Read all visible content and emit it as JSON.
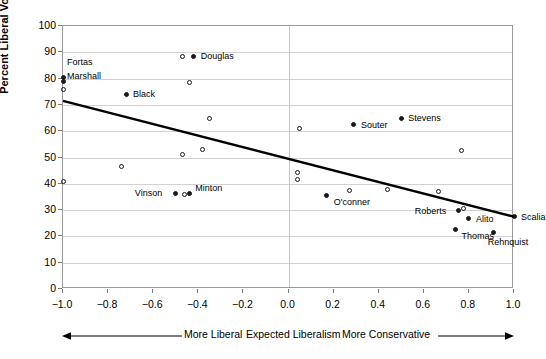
{
  "chart_data": {
    "type": "scatter",
    "title": "",
    "xlabel": "Expected Liberalism",
    "ylabel": "Percent Liberal Votes",
    "xlim": [
      -1.0,
      1.0
    ],
    "ylim": [
      0,
      100
    ],
    "grid": true,
    "legend": "none",
    "xticks": [
      "−1.0",
      "−0.8",
      "−0.6",
      "−0.4",
      "−0.2",
      "0.0",
      "0.2",
      "0.4",
      "0.6",
      "0.8",
      "1.0"
    ],
    "xtick_values": [
      -1.0,
      -0.8,
      -0.6,
      -0.4,
      -0.2,
      0.0,
      0.2,
      0.4,
      0.6,
      0.8,
      1.0
    ],
    "yticks": [
      "0",
      "10",
      "20",
      "30",
      "40",
      "50",
      "60",
      "70",
      "80",
      "90",
      "100"
    ],
    "ytick_values": [
      0,
      10,
      20,
      30,
      40,
      50,
      60,
      70,
      80,
      90,
      100
    ],
    "trendline": {
      "x0": -1.0,
      "y0": 71.5,
      "x1": 1.0,
      "y1": 27.5
    },
    "labeled_points": [
      {
        "name": "Fortas",
        "x": -1.0,
        "y": 80.5,
        "marker": "filled",
        "label_dx": 4,
        "label_dy": -20
      },
      {
        "name": "Marshall",
        "x": -1.0,
        "y": 79.0,
        "marker": "filled",
        "label_dx": 4,
        "label_dy": -10
      },
      {
        "name": "Douglas",
        "x": -0.42,
        "y": 88.5,
        "marker": "filled",
        "label_dx": 7,
        "label_dy": -5
      },
      {
        "name": "Black",
        "x": -0.72,
        "y": 74.0,
        "marker": "filled",
        "label_dx": 7,
        "label_dy": -5
      },
      {
        "name": "Souter",
        "x": 0.29,
        "y": 62.5,
        "marker": "filled",
        "label_dx": 7,
        "label_dy": -5
      },
      {
        "name": "Stevens",
        "x": 0.5,
        "y": 65.0,
        "marker": "filled",
        "label_dx": 7,
        "label_dy": -5
      },
      {
        "name": "Vinson",
        "x": -0.5,
        "y": 36.5,
        "marker": "filled",
        "label_dx": -41,
        "label_dy": -5
      },
      {
        "name": "Minton",
        "x": -0.44,
        "y": 36.5,
        "marker": "filled",
        "label_dx": 6,
        "label_dy": -10
      },
      {
        "name": "O'conner",
        "x": 0.17,
        "y": 35.5,
        "marker": "filled",
        "label_dx": 7,
        "label_dy": 1
      },
      {
        "name": "Roberts",
        "x": 0.755,
        "y": 30.0,
        "marker": "filled",
        "label_dx": -44,
        "label_dy": -4
      },
      {
        "name": "Alito",
        "x": 0.8,
        "y": 27.0,
        "marker": "filled",
        "label_dx": 7,
        "label_dy": -4
      },
      {
        "name": "Thomas",
        "x": 0.74,
        "y": 22.5,
        "marker": "filled",
        "label_dx": 6,
        "label_dy": 1
      },
      {
        "name": "Rehnquist",
        "x": 0.91,
        "y": 21.5,
        "marker": "filled",
        "label_dx": -6,
        "label_dy": 4
      },
      {
        "name": "Scalia",
        "x": 1.0,
        "y": 27.5,
        "marker": "filled",
        "label_dx": 7,
        "label_dy": -5
      }
    ],
    "unlabeled_points": [
      {
        "x": -1.0,
        "y": 76.0,
        "marker": "open"
      },
      {
        "x": -1.0,
        "y": 41.0,
        "marker": "open"
      },
      {
        "x": -0.47,
        "y": 88.5,
        "marker": "open"
      },
      {
        "x": -0.44,
        "y": 78.5,
        "marker": "open"
      },
      {
        "x": -0.35,
        "y": 65.0,
        "marker": "open"
      },
      {
        "x": -0.38,
        "y": 53.0,
        "marker": "open"
      },
      {
        "x": -0.47,
        "y": 51.0,
        "marker": "open"
      },
      {
        "x": -0.74,
        "y": 46.5,
        "marker": "open"
      },
      {
        "x": -0.46,
        "y": 36.0,
        "marker": "open"
      },
      {
        "x": 0.05,
        "y": 61.0,
        "marker": "open"
      },
      {
        "x": 0.04,
        "y": 44.5,
        "marker": "open"
      },
      {
        "x": 0.04,
        "y": 41.5,
        "marker": "open"
      },
      {
        "x": 0.27,
        "y": 37.5,
        "marker": "open"
      },
      {
        "x": 0.44,
        "y": 38.0,
        "marker": "open"
      },
      {
        "x": 0.665,
        "y": 37.0,
        "marker": "open"
      },
      {
        "x": 0.765,
        "y": 52.5,
        "marker": "open"
      },
      {
        "x": 0.775,
        "y": 30.5,
        "marker": "open"
      }
    ]
  },
  "annotations": {
    "more_liberal": "More Liberal",
    "expected_liberalism": "Expected Liberalism",
    "more_conservative": "More Conservative"
  }
}
